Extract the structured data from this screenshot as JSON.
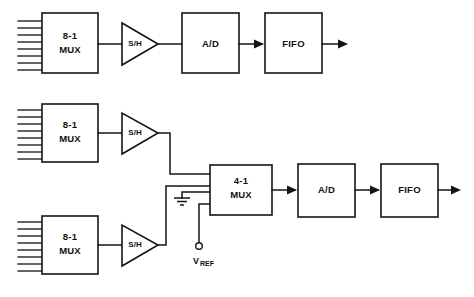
{
  "diagram": {
    "type": "block-diagram",
    "background_color": "#ffffff",
    "line_color": "#141414",
    "channels": [
      {
        "id": "channel-1",
        "row": "top",
        "input_line_count": 8,
        "blocks": [
          {
            "id": "mux-top",
            "label_line1": "8-1",
            "label_line2": "MUX",
            "shape": "rect"
          },
          {
            "id": "sh-top",
            "label": "S/H",
            "shape": "triangle"
          },
          {
            "id": "adc-top",
            "label": "A/D",
            "shape": "rect"
          },
          {
            "id": "fifo-top",
            "label": "FIFO",
            "shape": "rect"
          }
        ],
        "output": "arrow-right"
      },
      {
        "id": "channel-2",
        "row": "middle",
        "input_line_count": 8,
        "blocks": [
          {
            "id": "mux-mid",
            "label_line1": "8-1",
            "label_line2": "MUX",
            "shape": "rect"
          },
          {
            "id": "sh-mid",
            "label": "S/H",
            "shape": "triangle"
          }
        ]
      },
      {
        "id": "channel-3",
        "row": "bottom",
        "input_line_count": 8,
        "blocks": [
          {
            "id": "mux-bot",
            "label_line1": "8-1",
            "label_line2": "MUX",
            "shape": "rect"
          },
          {
            "id": "sh-bot",
            "label": "S/H",
            "shape": "triangle"
          }
        ]
      }
    ],
    "shared_path": {
      "mux": {
        "id": "mux-4to1",
        "label_line1": "4-1",
        "label_line2": "MUX",
        "shape": "rect",
        "input_count": 4
      },
      "adc": {
        "id": "adc-bottom",
        "label": "A/D",
        "shape": "rect"
      },
      "fifo": {
        "id": "fifo-bottom",
        "label": "FIFO",
        "shape": "rect"
      },
      "output": "arrow-right"
    },
    "references": {
      "ground": {
        "id": "ground-symbol",
        "symbol": "ground"
      },
      "vref": {
        "id": "vref-terminal",
        "label_main": "V",
        "label_sub": "REF",
        "symbol": "open-circle-terminal"
      }
    }
  }
}
